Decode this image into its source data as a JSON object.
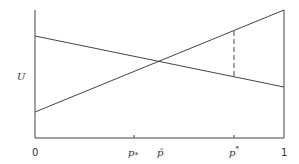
{
  "diagram": {
    "y_axis_label": "U",
    "x_ticks": [
      {
        "label": "0",
        "pos": 0
      },
      {
        "label": "p",
        "sub": "*",
        "pos": 0.4
      },
      {
        "label": "p̂",
        "pos": 0.5
      },
      {
        "label": "p",
        "sup": "*",
        "pos": 0.8
      },
      {
        "label": "1",
        "pos": 1
      }
    ],
    "lines": [
      {
        "name": "decreasing-utility-line",
        "from": [
          0,
          0.8
        ],
        "to": [
          1,
          0.4
        ]
      },
      {
        "name": "increasing-utility-line",
        "from": [
          0,
          0.2
        ],
        "to": [
          1,
          1.0
        ]
      }
    ],
    "dashed_marker_at": "p*"
  },
  "labels": {
    "u": "U",
    "zero": "0",
    "p_sub": "p",
    "p_sub_mark": "*",
    "p_hat": "p̂",
    "p_sup": "p",
    "p_sup_mark": "*",
    "one": "1"
  }
}
